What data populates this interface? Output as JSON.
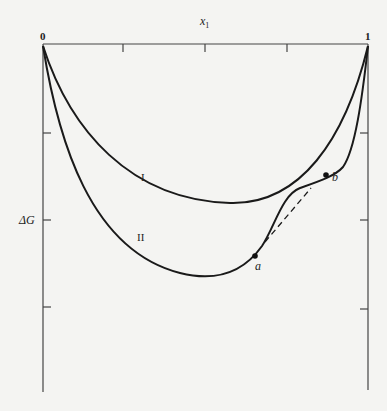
{
  "diagram": {
    "x_axis_label": "x",
    "x_axis_subscript": "1",
    "x_start_label": "0",
    "x_end_label": "1",
    "y_axis_label": "ΔG",
    "curves": [
      {
        "id": "I",
        "label": "I",
        "style": "solid"
      },
      {
        "id": "II",
        "label": "II",
        "style": "solid"
      }
    ],
    "points": [
      {
        "label": "a"
      },
      {
        "label": "b"
      }
    ],
    "tangent_line": {
      "style": "dashed",
      "from": "a",
      "to": "b"
    },
    "colors": {
      "line": "#1a1a1a",
      "axis": "#444444",
      "background": "#f4f4f2"
    }
  }
}
